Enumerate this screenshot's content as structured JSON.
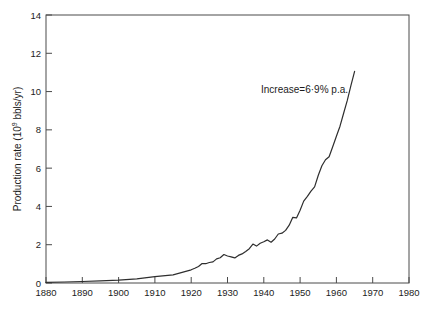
{
  "chart_data": {
    "type": "line",
    "title": "",
    "xlabel": "",
    "ylabel": "Production rate (10⁹ bbls/yr)",
    "ylabel_parts": [
      "Production rate (10",
      "9",
      " bbls/yr)"
    ],
    "xlim": [
      1880,
      1980
    ],
    "ylim": [
      0,
      14
    ],
    "xticks": [
      1880,
      1890,
      1900,
      1910,
      1920,
      1930,
      1940,
      1950,
      1960,
      1970,
      1980
    ],
    "yticks": [
      0,
      2,
      4,
      6,
      8,
      10,
      12,
      14
    ],
    "grid": false,
    "legend_position": "none",
    "frame": true,
    "line_color": "#2e2e2e",
    "axis_color": "#4a4a4a",
    "text_color": "#1c1c1c",
    "annotation": {
      "text": "Increase=6·9% p.a.",
      "x": 1963.2,
      "y": 9.95,
      "anchor": "end"
    },
    "series": [
      {
        "name": "production-rate",
        "x": [
          1880,
          1885,
          1890,
          1895,
          1900,
          1905,
          1910,
          1915,
          1920,
          1921,
          1922,
          1923,
          1924,
          1925,
          1926,
          1927,
          1928,
          1929,
          1930,
          1931,
          1932,
          1933,
          1934,
          1935,
          1936,
          1937,
          1938,
          1939,
          1940,
          1941,
          1942,
          1943,
          1944,
          1945,
          1946,
          1947,
          1948,
          1949,
          1950,
          1951,
          1952,
          1953,
          1954,
          1955,
          1956,
          1957,
          1958,
          1959,
          1960,
          1961,
          1962,
          1963,
          1964,
          1965
        ],
        "y": [
          0.03,
          0.05,
          0.08,
          0.11,
          0.15,
          0.22,
          0.33,
          0.43,
          0.69,
          0.77,
          0.86,
          1.02,
          1.01,
          1.07,
          1.1,
          1.26,
          1.32,
          1.49,
          1.41,
          1.37,
          1.31,
          1.44,
          1.52,
          1.65,
          1.79,
          2.03,
          1.93,
          2.08,
          2.15,
          2.25,
          2.13,
          2.3,
          2.56,
          2.6,
          2.75,
          3.02,
          3.43,
          3.4,
          3.8,
          4.28,
          4.53,
          4.8,
          5.02,
          5.63,
          6.12,
          6.44,
          6.6,
          7.13,
          7.67,
          8.19,
          8.88,
          9.54,
          10.31,
          11.06
        ]
      }
    ]
  }
}
